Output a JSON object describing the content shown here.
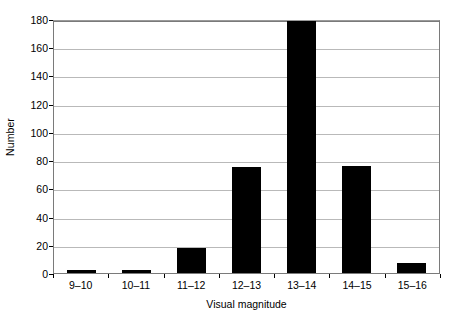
{
  "chart_data": {
    "type": "bar",
    "title": "",
    "xlabel": "Visual magnitude",
    "ylabel": "Number",
    "categories": [
      "9–10",
      "10–11",
      "11–12",
      "12–13",
      "13–14",
      "14–15",
      "15–16"
    ],
    "values": [
      2,
      2,
      18,
      75,
      180,
      76,
      7
    ],
    "ylim": [
      0,
      180
    ],
    "ytick_step": 20,
    "yticks": [
      0,
      20,
      40,
      60,
      80,
      100,
      120,
      140,
      160,
      180
    ],
    "ytick_labels": [
      "0",
      "20",
      "40",
      "60",
      "80",
      "100",
      "120",
      "140",
      "160",
      "180"
    ],
    "grid": "horizontal",
    "legend": null,
    "bar_color": "#000000",
    "gridline_color": "#b9b9b9",
    "frame_color": "#7a7a7a",
    "background_color": "#ffffff"
  }
}
